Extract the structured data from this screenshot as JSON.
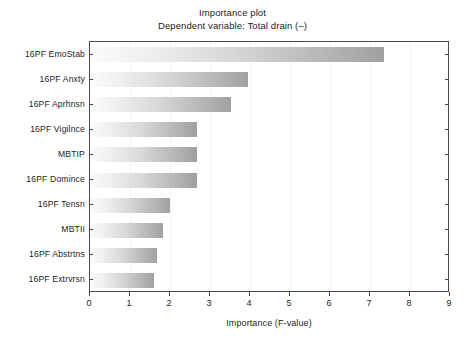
{
  "chart_data": {
    "type": "bar",
    "orientation": "horizontal",
    "title": "Importance plot",
    "subtitle": "Dependent variable: Total drain (–)",
    "xlabel": "Importance (F-value)",
    "ylabel": "",
    "xlim": [
      0,
      9
    ],
    "xticks": [
      "0",
      "1",
      "2",
      "3",
      "4",
      "5",
      "6",
      "7",
      "8",
      "9"
    ],
    "grid": true,
    "legend": false,
    "categories": [
      "16PF  EmoStab",
      "16PF Anxty",
      "16PF  Aprhnsn",
      "16PF Vigilnce",
      "MBTIP",
      "16PF  Domince",
      "16PF  Tensn",
      "MBTII",
      "16PF  Abstrtns",
      "16PF  Extrvrsn"
    ],
    "values": [
      7.35,
      3.95,
      3.52,
      2.67,
      2.67,
      2.67,
      2.0,
      1.82,
      1.67,
      1.6
    ],
    "bar_gradient_start": "#fbfbfb",
    "bar_gradient_end": "#a0a0a0",
    "frame_color": "#4a4a4a",
    "gridline_color": "#f2f2f2",
    "background": "#ffffff"
  }
}
